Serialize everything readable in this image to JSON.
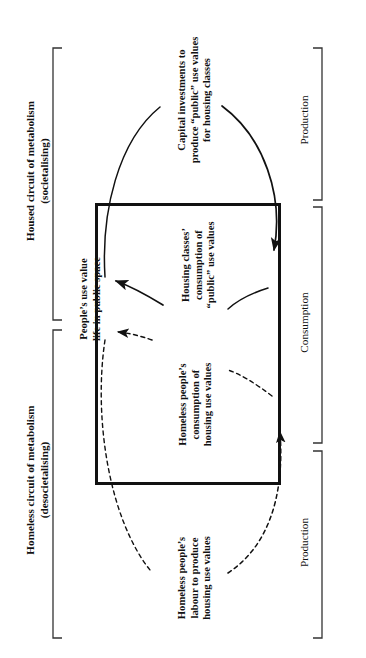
{
  "diagram": {
    "groups": [
      {
        "id": "housed",
        "title": "Housed circuit of metabolism",
        "subtitle": "(societalising)"
      },
      {
        "id": "homeless",
        "title": "Homeless circuit of metabolism",
        "subtitle": "(desocietalising)"
      }
    ],
    "phases": [
      {
        "id": "production-top",
        "label": "Production"
      },
      {
        "id": "consumption",
        "label": "Consumption"
      },
      {
        "id": "production-bottom",
        "label": "Production"
      }
    ],
    "nodes": [
      {
        "id": "capital-investments",
        "lines": "Capital investments to\nproduce “public” use values\nfor housing classes",
        "circuit": "housed",
        "phase": "production"
      },
      {
        "id": "housing-classes-consumption",
        "lines": "Housing classes’\nconsumption of\n“public” use values",
        "circuit": "housed",
        "phase": "consumption"
      },
      {
        "id": "peoples-use-value",
        "lines": "People’s use value\nlife in public space",
        "circuit": "shared",
        "phase": "outcome"
      },
      {
        "id": "homeless-consumption",
        "lines": "Homeless people’s\nconsumption of\nhousing use values",
        "circuit": "homeless",
        "phase": "consumption"
      },
      {
        "id": "homeless-labour",
        "lines": "Homeless people’s\nlabour to produce\nhousing use values",
        "circuit": "homeless",
        "phase": "production"
      }
    ],
    "flows": [
      {
        "id": "housed-production-arc",
        "style": "solid",
        "from": "peoples-use-value",
        "to": "capital-investments-to-box"
      },
      {
        "id": "housed-consumption-arrow",
        "style": "solid",
        "from": "housing-classes-consumption",
        "to": "peoples-use-value"
      },
      {
        "id": "homeless-consumption-arrow",
        "style": "dashed",
        "from": "homeless-consumption",
        "to": "peoples-use-value"
      },
      {
        "id": "homeless-production-arc",
        "style": "dashed",
        "from": "homeless-labour",
        "to": "homeless-consumption"
      }
    ],
    "colors": {
      "stroke": "#111111",
      "background": "#ffffff",
      "bracket": "#333333"
    }
  }
}
